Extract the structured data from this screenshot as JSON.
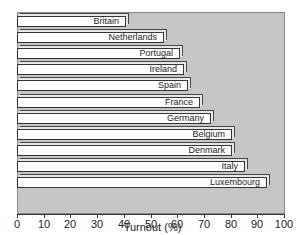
{
  "chart_data": {
    "type": "bar",
    "orientation": "horizontal",
    "title": "",
    "xlabel": "Turnout (%)",
    "ylabel": "",
    "xlim": [
      0,
      100
    ],
    "xticks": [
      "0",
      "10",
      "20",
      "30",
      "40",
      "50",
      "60",
      "70",
      "80",
      "90",
      "100"
    ],
    "grid": false,
    "legend": null,
    "categories": [
      "Britain",
      "Netherlands",
      "Portugal",
      "Ireland",
      "Spain",
      "France",
      "Germany",
      "Belgium",
      "Denmark",
      "Italy",
      "Luxembourg"
    ],
    "values": [
      41,
      55,
      61,
      62.5,
      64,
      68.5,
      72.5,
      80.5,
      80.5,
      85.5,
      93.5
    ],
    "bar_color": "#ffffff",
    "background_color": "#c6c6c6"
  }
}
